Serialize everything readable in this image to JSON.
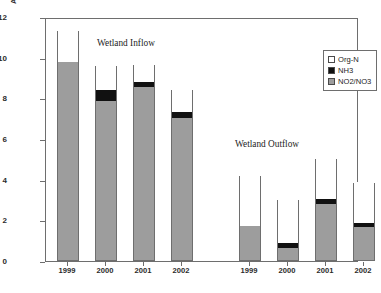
{
  "chart_data": {
    "type": "bar",
    "stacked": true,
    "title": "",
    "xlabel": "",
    "ylabel": "Avg. Conc. for Non Winter Months (mg N/L)",
    "ylim": [
      0,
      12
    ],
    "ytick_values": [
      0,
      2,
      4,
      6,
      8,
      10,
      12
    ],
    "ytick_labels": [
      "0",
      "2",
      "4",
      "6",
      "8",
      "10",
      "12"
    ],
    "grid": false,
    "legend_position": "top-right",
    "categories": [
      "1999",
      "2000",
      "2001",
      "2002",
      "1999",
      "2000",
      "2001",
      "2002"
    ],
    "groups": [
      {
        "name": "Wetland Inflow",
        "categories": [
          "1999",
          "2000",
          "2001",
          "2002"
        ]
      },
      {
        "name": "Wetland Outflow",
        "categories": [
          "1999",
          "2000",
          "2001",
          "2002"
        ]
      }
    ],
    "series": [
      {
        "name": "NO2/NO3",
        "color": "#9d9d9d",
        "values": [
          9.75,
          7.8,
          8.5,
          7.0,
          1.65,
          0.6,
          2.75,
          1.6
        ]
      },
      {
        "name": "NH3",
        "color": "#111111",
        "values": [
          0.0,
          0.55,
          0.25,
          0.3,
          0.0,
          0.25,
          0.25,
          0.2
        ]
      },
      {
        "name": "Org-N",
        "color": "#ffffff",
        "values": [
          1.55,
          1.25,
          0.9,
          1.1,
          2.55,
          2.15,
          2.0,
          2.05
        ]
      }
    ],
    "totals": [
      11.3,
      9.6,
      9.65,
      8.4,
      4.2,
      3.0,
      5.0,
      3.85
    ],
    "bars": [
      {
        "group": "Wetland Inflow",
        "category": "1999",
        "no2_no3": 9.75,
        "nh3": 9.75,
        "total": 11.3
      },
      {
        "group": "Wetland Inflow",
        "category": "2000",
        "no2_no3": 7.8,
        "nh3": 8.35,
        "total": 9.6
      },
      {
        "group": "Wetland Inflow",
        "category": "2001",
        "no2_no3": 8.5,
        "nh3": 8.75,
        "total": 9.65
      },
      {
        "group": "Wetland Inflow",
        "category": "2002",
        "no2_no3": 7.0,
        "nh3": 7.3,
        "total": 8.4
      },
      {
        "group": "Wetland Outflow",
        "category": "1999",
        "no2_no3": 1.65,
        "nh3": 1.65,
        "total": 4.2
      },
      {
        "group": "Wetland Outflow",
        "category": "2000",
        "no2_no3": 0.6,
        "nh3": 0.85,
        "total": 3.0
      },
      {
        "group": "Wetland Outflow",
        "category": "2001",
        "no2_no3": 2.75,
        "nh3": 3.0,
        "total": 5.0
      },
      {
        "group": "Wetland Outflow",
        "category": "2002",
        "no2_no3": 1.6,
        "nh3": 1.8,
        "total": 3.85
      }
    ],
    "annotations": [
      {
        "text": "Wetland Inflow",
        "x_px": 97,
        "y_px": 38
      },
      {
        "text": "Wetland Outflow",
        "x_px": 235,
        "y_px": 139
      }
    ],
    "legend": [
      {
        "label": "Org-N",
        "swatch": "#ffffff"
      },
      {
        "label": "NH3",
        "swatch": "#111111"
      },
      {
        "label": "NO2/NO3",
        "swatch": "#9d9d9d"
      }
    ]
  }
}
